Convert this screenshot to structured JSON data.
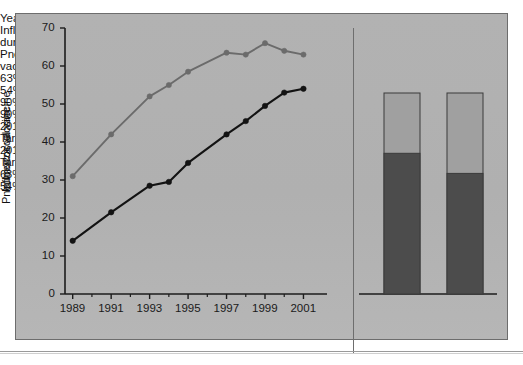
{
  "figure": {
    "background_color": "#b1b1b1",
    "border_color": "#6d6d6d"
  },
  "chart_data": {
    "type": "line",
    "title": "",
    "xlabel": "Year",
    "ylabel": "Percent",
    "xlim": [
      1988.6,
      2001.6
    ],
    "ylim": [
      0,
      70
    ],
    "ytick_values": [
      0,
      10,
      20,
      30,
      40,
      50,
      60,
      70
    ],
    "ytick_labels": [
      "0",
      "10",
      "20",
      "30",
      "40",
      "50",
      "60",
      "70"
    ],
    "xtick_labels": [
      "1989",
      "1991",
      "1993",
      "1995",
      "1997",
      "1999",
      "2001"
    ],
    "xtick_values": [
      1989,
      1991,
      1993,
      1995,
      1997,
      1999,
      2001
    ],
    "xminor_values": [
      1990,
      1992,
      1994,
      1996,
      1998,
      2000
    ],
    "grid": false,
    "legend_position": "inline-annotation",
    "x": [
      1989,
      1991,
      1993,
      1994,
      1995,
      1997,
      1998,
      1999,
      2000,
      2001
    ],
    "series": [
      {
        "name": "Influenza vaccination during past 12 months",
        "color": "#6b6b6b",
        "marker": "circle",
        "values": [
          31,
          42,
          52,
          55,
          58.5,
          63.5,
          63,
          66,
          64,
          63
        ],
        "end_label": "63%"
      },
      {
        "name": "Pneumococcal vaccination ever",
        "color": "#131313",
        "marker": "circle",
        "values": [
          14,
          21.5,
          28.5,
          29.5,
          34.5,
          42,
          45.5,
          49.5,
          53,
          54
        ],
        "end_label": "54%"
      }
    ],
    "annotations": [
      {
        "name": "influenza-series-label",
        "lines": [
          "Influenza vaccination",
          "during past 12 months"
        ]
      },
      {
        "name": "pneumococcal-series-label",
        "lines": [
          "Pneumococcal",
          "vaccination ever"
        ]
      }
    ]
  },
  "bar_panel": {
    "type": "bar",
    "axis_max": 90,
    "target_label_line1": "2010",
    "target_label_line2": "Target",
    "target_color": "#a0a0a0",
    "achieved_color": "#4c4c4c",
    "bars": [
      {
        "name": "influenza-vaccine-bar",
        "category": "Influenza vaccine",
        "target_top_label": "90%",
        "achieved_label": "63%",
        "achieved_value": 63,
        "target_value": 90
      },
      {
        "name": "pneumococcal-vaccine-bar",
        "category": "Pneumococcal vaccine",
        "target_top_label": "90%",
        "achieved_label": "54%",
        "achieved_value": 54,
        "target_value": 90
      }
    ]
  }
}
